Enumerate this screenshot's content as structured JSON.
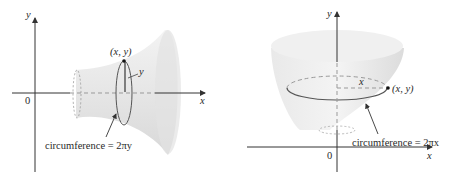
{
  "left_figure": {
    "description": "Surface of revolution about the x-axis",
    "axis_x_label": "x",
    "axis_y_label": "y",
    "origin_label": "0",
    "point_label": "(x, y)",
    "radius_label": "y",
    "circumference_label": "circumference = 2πy"
  },
  "right_figure": {
    "description": "Surface of revolution about the y-axis",
    "axis_x_label": "x",
    "axis_y_label": "y",
    "origin_label": "0",
    "point_label": "(x, y)",
    "radius_label": "x",
    "circumference_label": "circumference = 2πx"
  },
  "colors": {
    "surface_fill": "#ececec",
    "surface_shade": "#d9d9d9",
    "axis": "#333333",
    "circle": "#555555",
    "dashed": "#9a9a9a"
  }
}
